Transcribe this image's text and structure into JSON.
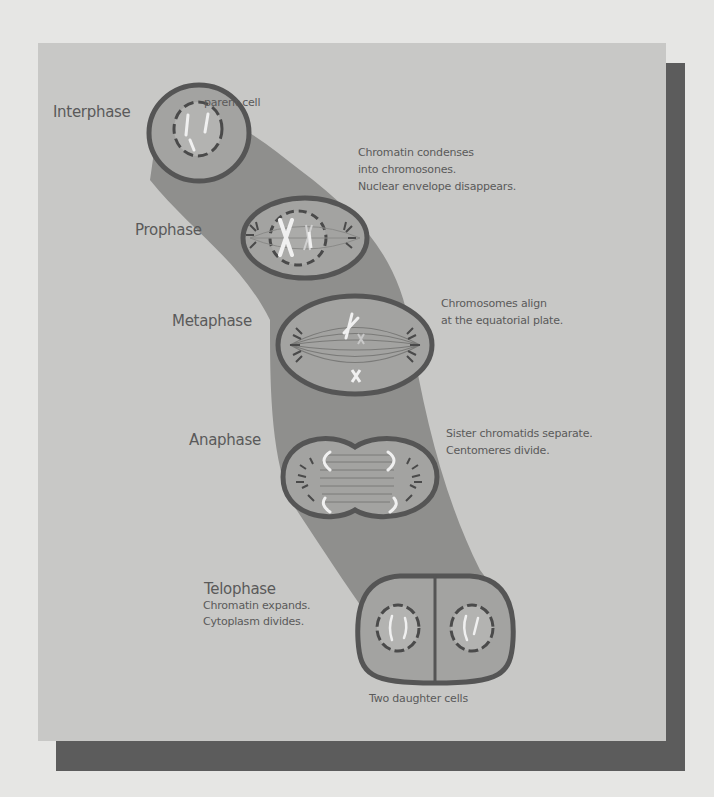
{
  "colors": {
    "page_background": "#e6e6e4",
    "panel_background": "#c8c8c6",
    "panel_shadow": "#5c5c5c",
    "band": "#8f8f8d",
    "cell_fill": "#a3a3a1",
    "cell_outline": "#555555",
    "chromosome": "#f0f0f0",
    "text": "#5a5a5a"
  },
  "diagram": {
    "labels": {
      "parent_cell": "parent cell",
      "daughter_cells": "Two daughter cells"
    },
    "stages": [
      {
        "name": "Interphase",
        "description": []
      },
      {
        "name": "Prophase",
        "description": [
          "Chromatin condenses",
          "into chromosones.",
          "Nuclear envelope disappears."
        ]
      },
      {
        "name": "Metaphase",
        "description": [
          "Chromosomes align",
          "at the equatorial plate."
        ]
      },
      {
        "name": "Anaphase",
        "description": [
          "Sister chromatids separate.",
          "Centomeres divide."
        ]
      },
      {
        "name": "Telophase",
        "description": [
          "Chromatin expands.",
          "Cytoplasm divides."
        ]
      }
    ]
  }
}
